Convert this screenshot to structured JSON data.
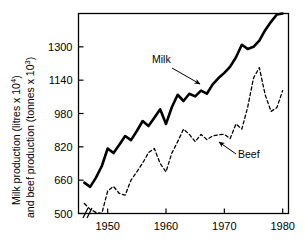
{
  "chart_data": {
    "type": "line",
    "title": "",
    "xlabel": "",
    "ylabel": "Milk production (litres x 10^4) and beef production (tonnes x 10^3)",
    "ylabel_line1_prefix": "Milk production (litres x 10",
    "ylabel_line1_sup": "4",
    "ylabel_line1_suffix": ")",
    "ylabel_line2_prefix": "and beef production (tonnes x 10",
    "ylabel_line2_sup": "3",
    "ylabel_line2_suffix": ")",
    "xlim": [
      1945,
      1981
    ],
    "ylim": [
      500,
      1460
    ],
    "grid": false,
    "legend_position": "inline-annotations",
    "axis_break": "//",
    "axis_break_note": "broken x-axis near origin",
    "y_ticks": [
      500,
      660,
      820,
      980,
      1140,
      1300
    ],
    "y_tick_labels": [
      "500",
      "660",
      "820",
      "980",
      "1140",
      "1300"
    ],
    "x_ticks": [
      1950,
      1960,
      1970,
      1980
    ],
    "x_tick_labels": [
      "1950",
      "1960",
      "1970",
      "1980"
    ],
    "series": [
      {
        "name": "Milk",
        "style": "solid",
        "color": "#000000",
        "line_width": 2.6,
        "annotation": "Milk",
        "x": [
          1946,
          1947,
          1948,
          1949,
          1950,
          1951,
          1952,
          1953,
          1954,
          1955,
          1956,
          1957,
          1958,
          1959,
          1960,
          1961,
          1962,
          1963,
          1964,
          1965,
          1966,
          1967,
          1968,
          1969,
          1970,
          1971,
          1972,
          1973,
          1974,
          1975,
          1976,
          1977,
          1978,
          1979,
          1980
        ],
        "values": [
          648,
          628,
          672,
          728,
          812,
          790,
          830,
          872,
          852,
          896,
          944,
          920,
          960,
          1000,
          930,
          1010,
          1070,
          1040,
          1075,
          1062,
          1090,
          1075,
          1120,
          1150,
          1175,
          1205,
          1250,
          1310,
          1290,
          1300,
          1330,
          1380,
          1420,
          1455,
          1460
        ]
      },
      {
        "name": "Beef",
        "style": "dashed",
        "color": "#000000",
        "line_width": 1.3,
        "annotation": "Beef",
        "x": [
          1946,
          1947,
          1948,
          1949,
          1950,
          1951,
          1952,
          1953,
          1954,
          1955,
          1956,
          1957,
          1958,
          1959,
          1960,
          1961,
          1962,
          1963,
          1964,
          1965,
          1966,
          1967,
          1968,
          1969,
          1970,
          1971,
          1972,
          1973,
          1974,
          1975,
          1976,
          1977,
          1978,
          1979,
          1980
        ],
        "values": [
          548,
          520,
          505,
          500,
          608,
          630,
          596,
          588,
          660,
          700,
          742,
          792,
          812,
          740,
          700,
          790,
          845,
          905,
          880,
          845,
          880,
          855,
          872,
          878,
          880,
          860,
          930,
          905,
          1010,
          1150,
          1200,
          1070,
          990,
          1008,
          1090
        ]
      }
    ],
    "annotations": [
      {
        "text": "Milk",
        "text_x": 152,
        "text_y": 63,
        "arrow_from_x": 172,
        "arrow_from_y": 68,
        "arrow_to_x": 200,
        "arrow_to_y": 84
      },
      {
        "text": "Beef",
        "text_x": 238,
        "text_y": 158,
        "arrow_from_x": 236,
        "arrow_from_y": 154,
        "arrow_to_x": 219,
        "arrow_to_y": 142
      }
    ]
  }
}
